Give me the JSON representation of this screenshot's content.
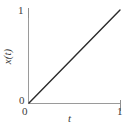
{
  "chart_data": {
    "type": "line",
    "title": "",
    "subtitle": "",
    "xlabel": "t",
    "ylabel": "x(t)",
    "xlim": [
      0,
      1
    ],
    "ylim": [
      0,
      1
    ],
    "xticks": [
      "0",
      "1"
    ],
    "yticks": [
      "0",
      "1"
    ],
    "grid": false,
    "legend": null,
    "annotations": [],
    "series": [
      {
        "name": "x(t)",
        "x": [
          0,
          1
        ],
        "values": [
          0,
          1
        ],
        "color": "#2b2b2b",
        "style": "solid"
      }
    ]
  },
  "axes": {
    "y": {
      "title": "x(t)",
      "tick_min": "0",
      "tick_max": "1"
    },
    "x": {
      "title": "t",
      "tick_min": "0",
      "tick_max": "1"
    }
  },
  "colors": {
    "background": "#ffffff",
    "axis": "#9a9a9a",
    "line": "#2b2b2b",
    "text": "#3b3b3b"
  }
}
